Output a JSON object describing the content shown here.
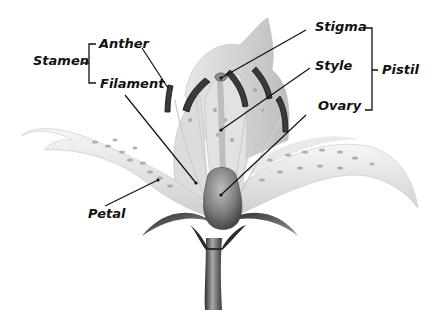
{
  "diagram": {
    "groups": [
      {
        "name": "Stamen",
        "parts": [
          "Anther",
          "Filament"
        ]
      },
      {
        "name": "Pistil",
        "parts": [
          "Stigma",
          "Style",
          "Ovary"
        ]
      }
    ],
    "labels": {
      "stamen": "Stamen",
      "anther": "Anther",
      "filament": "Filament",
      "stigma": "Stigma",
      "style": "Style",
      "ovary": "Ovary",
      "pistil": "Pistil",
      "petal": "Petal"
    },
    "colors": {
      "background": "#ffffff",
      "petal": "#e6e6e6",
      "spots": "#9a9a9a",
      "anther": "#3a3a3a",
      "ovary": "#777777",
      "stem": "#5a5a5a",
      "leader": "#111111"
    }
  }
}
